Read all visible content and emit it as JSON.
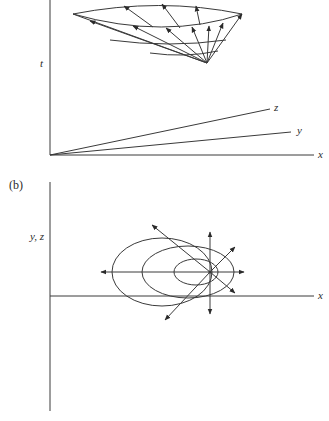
{
  "figure": {
    "panel_a": {
      "axis_labels": {
        "vertical": "t",
        "x": "x",
        "y": "y",
        "z": "z"
      },
      "description": "Light cone in spacetime: a cone of arrows (world-line directions) emanating from an event, bounded by a curved rim"
    },
    "panel_b": {
      "panel_label": "(b)",
      "axis_labels": {
        "vertical": "y, z",
        "x": "x"
      },
      "description": "Projection onto space: three nested ellipses (wavefronts) around a point, with six arrows radiating from the point"
    },
    "colors": {
      "ink": "#3a3a3a",
      "background": "#ffffff"
    }
  }
}
